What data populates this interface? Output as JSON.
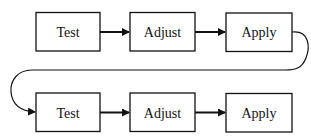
{
  "diagram": {
    "type": "flowchart",
    "rows": [
      {
        "name": "row-1",
        "steps": [
          {
            "label": "Test"
          },
          {
            "label": "Adjust"
          },
          {
            "label": "Apply"
          }
        ]
      },
      {
        "name": "row-2",
        "steps": [
          {
            "label": "Test"
          },
          {
            "label": "Adjust"
          },
          {
            "label": "Apply"
          }
        ]
      }
    ],
    "edges": [
      {
        "from": "row-1.Test",
        "to": "row-1.Adjust"
      },
      {
        "from": "row-1.Adjust",
        "to": "row-1.Apply"
      },
      {
        "from": "row-1.Apply",
        "to": "row-2.Test",
        "style": "loop-back"
      },
      {
        "from": "row-2.Test",
        "to": "row-2.Adjust"
      },
      {
        "from": "row-2.Adjust",
        "to": "row-2.Apply"
      }
    ],
    "colors": {
      "stroke": "#111111",
      "background": "#ffffff"
    }
  }
}
